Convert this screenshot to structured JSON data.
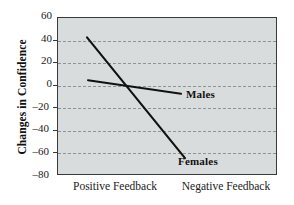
{
  "chart_data": {
    "type": "line",
    "title": "",
    "xlabel": "",
    "ylabel": "Changes in Confidence",
    "categories": [
      "Positive Feedback",
      "Negative Feedback"
    ],
    "ylim": [
      -80,
      60
    ],
    "yticks": [
      60,
      40,
      20,
      0,
      -20,
      -40,
      -60,
      -80
    ],
    "ytick_labels": [
      "60",
      "40",
      "20",
      "0",
      "–20",
      "–40",
      "–60",
      "–80"
    ],
    "grid": "horizontal-dashed",
    "legend": "inline-labels",
    "series": [
      {
        "name": "Males",
        "label": "Males",
        "values": [
          4,
          -8
        ],
        "color": "#111111"
      },
      {
        "name": "Females",
        "label": "Females",
        "values": [
          42,
          -65
        ],
        "color": "#111111"
      }
    ],
    "background_color": "#d9dcdc",
    "border_color": "#3a3a3a",
    "gridline_color": "#8d9496"
  },
  "axes": {
    "y_title": "Changes in Confidence",
    "x_labels": [
      {
        "text": "Positive Feedback"
      },
      {
        "text": "Negative Feedback"
      }
    ],
    "y_labels": [
      {
        "text": "60"
      },
      {
        "text": "40"
      },
      {
        "text": "20"
      },
      {
        "text": "0"
      },
      {
        "text": "–20"
      },
      {
        "text": "–40"
      },
      {
        "text": "–60"
      },
      {
        "text": "–80"
      }
    ]
  },
  "series_labels": [
    {
      "text": "Males"
    },
    {
      "text": "Females"
    }
  ]
}
